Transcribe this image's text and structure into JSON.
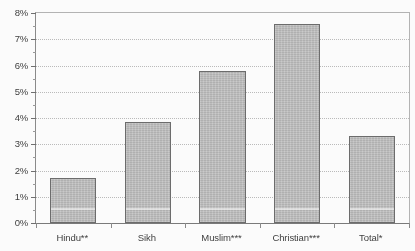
{
  "chart_data": {
    "type": "bar",
    "title": "",
    "subtitle": "",
    "xlabel": "",
    "ylabel": "",
    "categories": [
      "Hindu**",
      "Sikh",
      "Muslim***",
      "Christian***",
      "Total*"
    ],
    "values": [
      1.7,
      3.85,
      5.8,
      7.6,
      3.3
    ],
    "values_display": [
      "1.7%",
      "3.9%",
      "5.8%",
      "7.6%",
      "3.3%"
    ],
    "series": [
      {
        "name": "",
        "values": [
          1.7,
          3.85,
          5.8,
          7.6,
          3.3
        ]
      }
    ],
    "ylim": [
      0,
      8
    ],
    "ytick_step": 1,
    "yminor_step": 0.5,
    "ytick_labels": [
      "0%",
      "1%",
      "2%",
      "3%",
      "4%",
      "5%",
      "6%",
      "7%",
      "8%"
    ],
    "ytick_values": [
      0,
      1,
      2,
      3,
      4,
      5,
      6,
      7,
      8
    ],
    "grid": true,
    "grid_axis": "y",
    "legend": false,
    "legend_position": "none",
    "bar_color": "#bfbfbf",
    "bar_border_color": "#6b6b6b",
    "grid_color": "#bcbcbc",
    "axis_color": "#7a7a7a",
    "text_color": "#3d3d3d",
    "background": "#ffffff"
  }
}
